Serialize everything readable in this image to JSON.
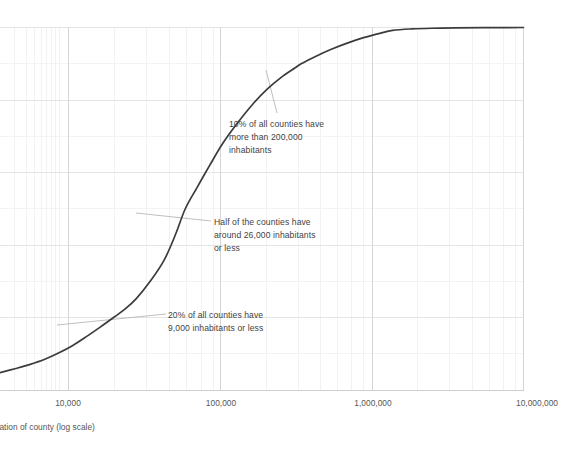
{
  "chart_data": {
    "type": "line",
    "title": "",
    "subtitle": "",
    "xlabel": "Population of county (log scale)",
    "ylabel": "",
    "xscale": "log",
    "xlim": [
      1000,
      10000000
    ],
    "ylim": [
      0,
      100
    ],
    "grid": true,
    "legend": "none",
    "xticks": [
      {
        "value": 10000,
        "label": "10,000"
      },
      {
        "value": 100000,
        "label": "100,000"
      },
      {
        "value": 1000000,
        "label": "1,000,000"
      },
      {
        "value": 10000000,
        "label": "10,000,000"
      }
    ],
    "yticks": [
      {
        "value": 0,
        "label": ""
      },
      {
        "value": 20,
        "label": ""
      },
      {
        "value": 40,
        "label": ""
      },
      {
        "value": 60,
        "label": ""
      },
      {
        "value": 80,
        "label": ""
      },
      {
        "value": 100,
        "label": ""
      }
    ],
    "series": [
      {
        "name": "Cumulative share of counties",
        "color": "#3b3b3b",
        "points": [
          {
            "x": 1000,
            "y": 4.9
          },
          {
            "x": 1300,
            "y": 6.0
          },
          {
            "x": 1700,
            "y": 7.2
          },
          {
            "x": 2200,
            "y": 8.6
          },
          {
            "x": 2800,
            "y": 10.3
          },
          {
            "x": 3600,
            "y": 12.4
          },
          {
            "x": 4600,
            "y": 14.9
          },
          {
            "x": 5900,
            "y": 17.6
          },
          {
            "x": 7500,
            "y": 20.3
          },
          {
            "x": 9000,
            "y": 22.4
          },
          {
            "x": 11000,
            "y": 25.3
          },
          {
            "x": 14000,
            "y": 30.0
          },
          {
            "x": 18000,
            "y": 36.0
          },
          {
            "x": 22000,
            "y": 43.1
          },
          {
            "x": 26000,
            "y": 50.0
          },
          {
            "x": 32000,
            "y": 55.9
          },
          {
            "x": 40000,
            "y": 62.0
          },
          {
            "x": 50000,
            "y": 67.9
          },
          {
            "x": 65000,
            "y": 73.6
          },
          {
            "x": 85000,
            "y": 78.8
          },
          {
            "x": 110000,
            "y": 83.0
          },
          {
            "x": 140000,
            "y": 86.2
          },
          {
            "x": 180000,
            "y": 88.9
          },
          {
            "x": 200000,
            "y": 90.0
          },
          {
            "x": 260000,
            "y": 92.1
          },
          {
            "x": 340000,
            "y": 94.0
          },
          {
            "x": 450000,
            "y": 95.7
          },
          {
            "x": 600000,
            "y": 97.2
          },
          {
            "x": 800000,
            "y": 98.4
          },
          {
            "x": 1000000,
            "y": 99.2
          },
          {
            "x": 1400000,
            "y": 99.6
          },
          {
            "x": 2000000,
            "y": 99.8
          },
          {
            "x": 3000000,
            "y": 99.9
          },
          {
            "x": 5000000,
            "y": 99.95
          },
          {
            "x": 10000000,
            "y": 100.0
          }
        ]
      }
    ],
    "annotations": [
      {
        "id": "annotation-10-percent",
        "text": "10% of all counties have\nmore than 200,000\ninhabitants",
        "anchor_x": 200000,
        "anchor_y": 90
      },
      {
        "id": "annotation-median",
        "text": "Half of the counties have\naround 26,000 inhabitants\nor less",
        "anchor_x": 26000,
        "anchor_y": 50
      },
      {
        "id": "annotation-20-percent",
        "text": "20% of all counties have\n9,000 inhabitants or less",
        "anchor_x": 9000,
        "anchor_y": 20
      }
    ],
    "colors": {
      "line": "#3b3b3b",
      "grid_major": "#d9d9d9",
      "grid_minor": "#f0f0f0",
      "axis": "#c8c8c8",
      "text": "#565656",
      "annotation_text": "#3f3f3f",
      "leader_line": "#b5b5b5"
    }
  }
}
